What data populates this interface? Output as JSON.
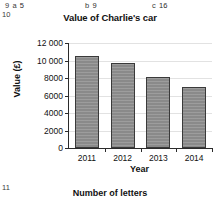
{
  "annotations": {
    "q9": {
      "number": "9",
      "part": "a",
      "answer": "5"
    },
    "q10": {
      "number": "10"
    },
    "part_b": {
      "label": "b",
      "answer": "9"
    },
    "part_c": {
      "label": "c",
      "answer": "16"
    },
    "q11": {
      "number": "11"
    }
  },
  "next_question": {
    "heading": "Number of letters"
  },
  "chart_data": {
    "type": "bar",
    "title": "Value of Charlie's car",
    "xlabel": "Year",
    "ylabel": "Value (£)",
    "categories": [
      "2011",
      "2012",
      "2013",
      "2014"
    ],
    "values": [
      10500,
      9700,
      8100,
      7000
    ],
    "ylim": [
      0,
      12000
    ],
    "ytick_labels": [
      "0",
      "2000",
      "4000",
      "6000",
      "8000",
      "10 000",
      "12 000"
    ],
    "ytick_values": [
      0,
      2000,
      4000,
      6000,
      8000,
      10000,
      12000
    ],
    "grid": true,
    "legend": "none",
    "bar_fill": "#8a8a8a",
    "bar_edge": "#3a3a3a",
    "axis_color": "#2b2b2b",
    "grid_color": "#e2e2e2"
  }
}
